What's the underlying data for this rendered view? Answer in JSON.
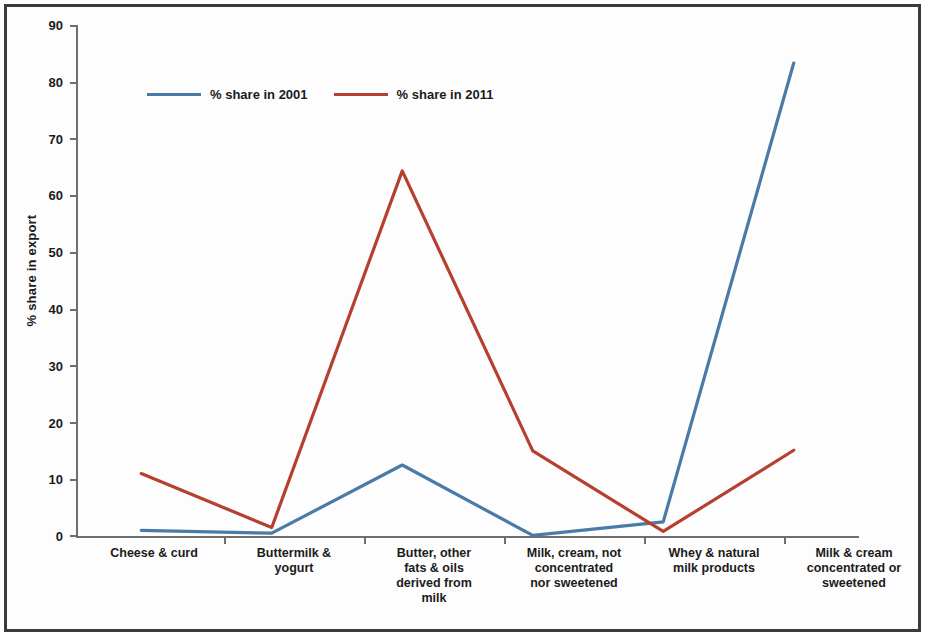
{
  "chart_data": {
    "type": "line",
    "title": "",
    "xlabel": "",
    "ylabel": "% share in export",
    "ylim": [
      0,
      90
    ],
    "yticks": [
      0,
      10,
      20,
      30,
      40,
      50,
      60,
      70,
      80,
      90
    ],
    "grid": false,
    "legend_position": "top-left inside plot",
    "categories": [
      "Cheese & curd",
      "Buttermilk & yogurt",
      "Butter, other fats & oils derived from milk",
      "Milk, cream, not concentrated nor sweetened",
      "Whey & natural milk products",
      "Milk & cream concentrated or sweetened"
    ],
    "series": [
      {
        "name": "% share in 2001",
        "color": "#4a7ba7",
        "values": [
          1.0,
          0.5,
          12.5,
          0.1,
          2.5,
          83.3
        ]
      },
      {
        "name": "% share in 2011",
        "color": "#b5402f",
        "values": [
          11.0,
          1.5,
          64.3,
          15.0,
          0.8,
          15.1
        ]
      }
    ]
  },
  "axis": {
    "y_title": "% share in export",
    "y_tick_labels": [
      "90",
      "80",
      "70",
      "60",
      "50",
      "40",
      "30",
      "20",
      "10",
      "0"
    ],
    "x_tick_labels": [
      "Cheese & curd",
      "Buttermilk &\nyogurt",
      "Butter, other\nfats & oils\nderived from\nmilk",
      "Milk, cream, not\nconcentrated\nnor sweetened",
      "Whey & natural\nmilk products",
      "Milk & cream\nconcentrated or\nsweetened"
    ]
  },
  "legend": {
    "entries": [
      {
        "label": "% share in 2001",
        "color": "#4a7ba7"
      },
      {
        "label": "% share in 2011",
        "color": "#b5402f"
      }
    ]
  },
  "colors": {
    "series_2001": "#4a7ba7",
    "series_2011": "#b5402f",
    "axis": "#6e6e6e",
    "frame": "#3a3a3a",
    "text": "#1b1b1b"
  }
}
